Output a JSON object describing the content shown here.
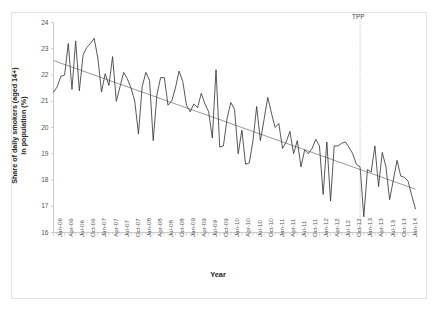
{
  "figure": {
    "xlabel": "Year",
    "ylabel_line1": "Share of daily smokers (aged 14+)",
    "ylabel_line2": "in population (%)",
    "annotation": "TPP",
    "annotation_x_category": "Dec-12",
    "series_color": "#3a3a3a",
    "trend_color": "#808080",
    "axis_color": "#bfbfbf",
    "text_color": "#555555"
  },
  "chart_data": {
    "type": "line",
    "title": "",
    "xlabel": "Year",
    "ylabel": "Share of daily smokers (aged 14+) in population (%)",
    "ylim": [
      16,
      24
    ],
    "yticks": [
      16,
      17,
      18,
      19,
      20,
      21,
      22,
      23,
      24
    ],
    "grid": false,
    "legend": "none",
    "annotations": [
      {
        "label": "TPP",
        "type": "vertical-line",
        "x": "Dec-12",
        "style": "dotted"
      }
    ],
    "xtick_labels": [
      "Jan-06",
      "Apr-06",
      "Jul-06",
      "Oct-06",
      "Jan-07",
      "Apr-07",
      "Jul-07",
      "Oct-07",
      "Jan-08",
      "Apr-08",
      "Jul-08",
      "Oct-08",
      "Jan-09",
      "Apr-09",
      "Jul-09",
      "Oct-09",
      "Jan-10",
      "Apr-10",
      "Jul-10",
      "Oct-10",
      "Jan-11",
      "Apr-11",
      "Jul-11",
      "Oct-11",
      "Jan-12",
      "Apr-12",
      "Jul-12",
      "Oct-12",
      "Jan-13",
      "Apr-13",
      "Jul-13",
      "Oct-13",
      "Jan-14"
    ],
    "x": [
      "Jan-06",
      "Feb-06",
      "Mar-06",
      "Apr-06",
      "May-06",
      "Jun-06",
      "Jul-06",
      "Aug-06",
      "Sep-06",
      "Oct-06",
      "Nov-06",
      "Dec-06",
      "Jan-07",
      "Feb-07",
      "Mar-07",
      "Apr-07",
      "May-07",
      "Jun-07",
      "Jul-07",
      "Aug-07",
      "Sep-07",
      "Oct-07",
      "Nov-07",
      "Dec-07",
      "Jan-08",
      "Feb-08",
      "Mar-08",
      "Apr-08",
      "May-08",
      "Jun-08",
      "Jul-08",
      "Aug-08",
      "Sep-08",
      "Oct-08",
      "Nov-08",
      "Dec-08",
      "Jan-09",
      "Feb-09",
      "Mar-09",
      "Apr-09",
      "May-09",
      "Jun-09",
      "Jul-09",
      "Aug-09",
      "Sep-09",
      "Oct-09",
      "Nov-09",
      "Dec-09",
      "Jan-10",
      "Feb-10",
      "Mar-10",
      "Apr-10",
      "May-10",
      "Jun-10",
      "Jul-10",
      "Aug-10",
      "Sep-10",
      "Oct-10",
      "Nov-10",
      "Dec-10",
      "Jan-11",
      "Feb-11",
      "Mar-11",
      "Apr-11",
      "May-11",
      "Jun-11",
      "Jul-11",
      "Aug-11",
      "Sep-11",
      "Oct-11",
      "Nov-11",
      "Dec-11",
      "Jan-12",
      "Feb-12",
      "Mar-12",
      "Apr-12",
      "May-12",
      "Jun-12",
      "Jul-12",
      "Aug-12",
      "Sep-12",
      "Oct-12",
      "Nov-12",
      "Dec-12",
      "Jan-13",
      "Feb-13",
      "Mar-13",
      "Apr-13",
      "May-13",
      "Jun-13",
      "Jul-13",
      "Aug-13",
      "Sep-13",
      "Oct-13",
      "Nov-13",
      "Dec-13",
      "Jan-14",
      "Feb-14",
      "Mar-14"
    ],
    "series": [
      {
        "name": "Share of daily smokers (aged 14+)",
        "values": [
          21.35,
          21.55,
          21.95,
          22.0,
          23.2,
          21.45,
          23.3,
          21.4,
          22.75,
          23.05,
          23.2,
          23.4,
          22.65,
          21.35,
          22.05,
          21.6,
          22.7,
          21.0,
          21.55,
          22.1,
          21.85,
          21.5,
          21.0,
          19.75,
          21.55,
          22.1,
          21.8,
          19.5,
          21.25,
          21.9,
          21.9,
          20.85,
          21.0,
          21.5,
          22.15,
          21.75,
          20.85,
          20.6,
          20.9,
          20.75,
          21.3,
          20.9,
          20.6,
          19.6,
          22.2,
          19.25,
          19.3,
          20.35,
          20.95,
          20.7,
          19.0,
          19.9,
          18.6,
          18.65,
          19.5,
          20.8,
          19.5,
          20.3,
          21.15,
          20.55,
          20.0,
          20.15,
          19.2,
          19.45,
          19.85,
          19.0,
          19.5,
          18.5,
          19.15,
          19.0,
          19.2,
          19.55,
          19.3,
          17.45,
          19.45,
          17.2,
          19.3,
          19.3,
          19.4,
          19.45,
          19.25,
          19.0,
          18.6,
          18.5,
          16.6,
          18.4,
          18.3,
          19.3,
          17.75,
          19.05,
          18.5,
          17.25,
          18.0,
          18.75,
          18.15,
          18.1,
          17.95,
          17.4,
          16.9
        ]
      }
    ],
    "trendline": {
      "name": "linear trend",
      "start_value": 22.55,
      "end_value": 17.65,
      "start_x": "Jan-06",
      "end_x": "Mar-14"
    }
  }
}
